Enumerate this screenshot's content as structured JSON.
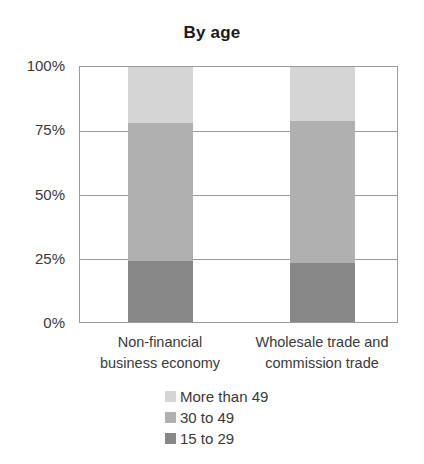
{
  "chart_data": {
    "type": "bar",
    "subtype": "stacked-percentage-column",
    "title": "By age",
    "xlabel": "",
    "ylabel": "",
    "ylim": [
      0,
      100
    ],
    "yticks": [
      "0%",
      "25%",
      "50%",
      "75%",
      "100%"
    ],
    "ytick_values": [
      0,
      25,
      50,
      75,
      100
    ],
    "grid": true,
    "legend_position": "bottom",
    "categories": [
      "Non-financial business economy",
      "Wholesale trade and commission trade"
    ],
    "category_label_lines": [
      [
        "Non-financial",
        "business economy"
      ],
      [
        "Wholesale trade and",
        "commission trade"
      ]
    ],
    "series": [
      {
        "name": "15 to 29",
        "color": "#888888",
        "values": [
          24,
          23
        ]
      },
      {
        "name": "30 to 49",
        "color": "#b0b0b0",
        "values": [
          54,
          56
        ]
      },
      {
        "name": "More than 49",
        "color": "#d5d5d5",
        "values": [
          22,
          21
        ]
      }
    ],
    "legend_order": [
      "More than 49",
      "30 to 49",
      "15 to 29"
    ]
  },
  "axis": {
    "tick_100": "100%",
    "tick_75": "75%",
    "tick_50": "50%",
    "tick_25": "25%",
    "tick_0": "0%"
  },
  "categories": {
    "cat0_line1": "Non-financial",
    "cat0_line2": "business economy",
    "cat1_line1": "Wholesale trade and",
    "cat1_line2": "commission trade"
  },
  "legend": {
    "item0": "More than 49",
    "item1": "30 to 49",
    "item2": "15 to 29"
  },
  "title": "By age",
  "colors": {
    "light": "#d5d5d5",
    "medium": "#b0b0b0",
    "dark": "#888888",
    "axis": "#9a9a9a",
    "text": "#3a3a3a"
  }
}
